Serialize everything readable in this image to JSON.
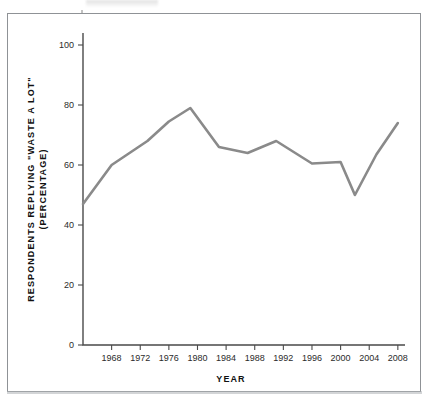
{
  "figure": {
    "background_color": "#ffffff",
    "frame_color": "#8f9296"
  },
  "chart_data": {
    "type": "line",
    "title": "",
    "subtitle": "",
    "xlabel": "YEAR",
    "ylabel": "RESPONDENTS REPLYING \"WASTE A LOT\" (PERCENTAGE)",
    "ylabel_line1": "RESPONDENTS REPLYING \"WASTE A LOT\"",
    "ylabel_line2": "(PERCENTAGE)",
    "xlim": [
      1964,
      2009
    ],
    "ylim": [
      0,
      104
    ],
    "xticks": [
      1968,
      1972,
      1976,
      1980,
      1984,
      1988,
      1992,
      1996,
      2000,
      2004,
      2008
    ],
    "xtick_labels": [
      "1968",
      "1972",
      "1976",
      "1980",
      "1984",
      "1988",
      "1992",
      "1996",
      "2000",
      "2004",
      "2008"
    ],
    "yticks": [
      0,
      20,
      40,
      60,
      80,
      100
    ],
    "ytick_labels": [
      "0",
      "20",
      "40",
      "60",
      "80",
      "100"
    ],
    "grid": false,
    "legend": null,
    "line_color": "#8a8a8a",
    "line_width": 2.6,
    "series": [
      {
        "name": "Respondents replying \"waste a lot\"",
        "x": [
          1964,
          1968,
          1973,
          1976,
          1979,
          1983,
          1987,
          1991,
          1996,
          2000,
          2002,
          2005,
          2008
        ],
        "values": [
          47,
          60,
          68,
          74.5,
          79,
          66,
          64,
          68,
          60.5,
          61,
          50,
          63.5,
          74
        ]
      }
    ],
    "annotations": []
  }
}
